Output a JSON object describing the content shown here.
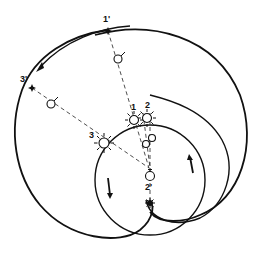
{
  "diagram": {
    "labels": {
      "p1_prime": "1'",
      "p3_prime": "3'",
      "p2_prime": "2'",
      "s1": "1",
      "s2": "2",
      "s3": "3"
    },
    "icons": {
      "star": "star-icon",
      "sun": "sun-icon",
      "planet": "planet-circle-icon",
      "arrow": "direction-arrow-icon"
    },
    "colors": {
      "line": "#111111",
      "background": "#ffffff"
    }
  }
}
